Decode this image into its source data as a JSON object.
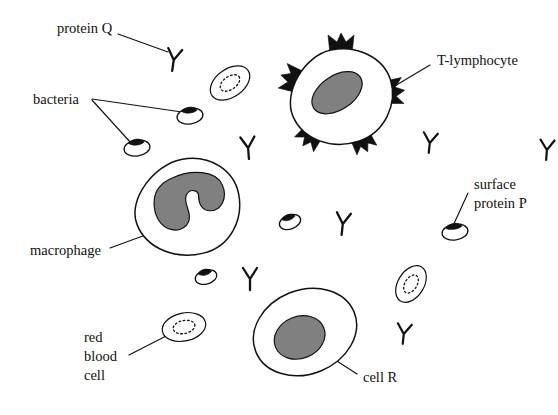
{
  "diagram": {
    "canvas": {
      "width": 558,
      "height": 415
    },
    "background_color": "#ffffff",
    "ink_color": "#111111",
    "nucleus_color": "#808080",
    "labels": [
      {
        "id": "protein-q",
        "text": "protein Q",
        "x": 57,
        "y": 30
      },
      {
        "id": "bacteria",
        "text": "bacteria",
        "x": 33,
        "y": 101
      },
      {
        "id": "t-lymphocyte",
        "text": "T-lymphocyte",
        "x": 437,
        "y": 62
      },
      {
        "id": "macrophage",
        "text": "macrophage",
        "x": 30,
        "y": 252
      },
      {
        "id": "cell-r",
        "text": "cell R",
        "x": 363,
        "y": 379
      },
      {
        "id": "surface-protein-p-line1",
        "text": "surface",
        "x": 474,
        "y": 186
      },
      {
        "id": "surface-protein-p-line2",
        "text": "protein P",
        "x": 474,
        "y": 205
      },
      {
        "id": "red-blood-cell-line1",
        "text": "red",
        "x": 84,
        "y": 339
      },
      {
        "id": "red-blood-cell-line2",
        "text": "blood",
        "x": 84,
        "y": 358
      },
      {
        "id": "red-blood-cell-line3",
        "text": "cell",
        "x": 84,
        "y": 377
      }
    ],
    "cells": [
      {
        "id": "t-lymphocyte",
        "name": "T-lymphocyte",
        "type": "lymphocyte",
        "center_x": 341,
        "center_y": 97,
        "radius_x": 52,
        "radius_y": 48,
        "rotation": -12,
        "nucleus_rx": 28,
        "nucleus_ry": 17,
        "nucleus_rotation": -22,
        "receptor_count": 5,
        "receptor_label": "surface receptor spikes"
      },
      {
        "id": "macrophage",
        "name": "macrophage",
        "type": "macrophage",
        "center_x": 187,
        "center_y": 207,
        "radius_x": 53,
        "radius_y": 48,
        "rotation": -8,
        "nucleus_shape": "multi-lobed"
      },
      {
        "id": "cell-r",
        "name": "cell R",
        "type": "generic-cell",
        "center_x": 305,
        "center_y": 332,
        "radius_x": 53,
        "radius_y": 42,
        "rotation": -22,
        "nucleus_rx": 26,
        "nucleus_ry": 21,
        "nucleus_rotation": -22
      }
    ],
    "red_blood_cells": [
      {
        "id": "rbc-top",
        "center_x": 230,
        "center_y": 83,
        "rx": 22,
        "ry": 14,
        "rotation": -35
      },
      {
        "id": "rbc-bottom-left",
        "center_x": 184,
        "center_y": 327,
        "rx": 22,
        "ry": 14,
        "rotation": -12
      },
      {
        "id": "rbc-right",
        "center_x": 411,
        "center_y": 284,
        "rx": 20,
        "ry": 13,
        "rotation": -58
      }
    ],
    "bacteria": [
      {
        "id": "bacterium-labeled-upper",
        "center_x": 190,
        "center_y": 116,
        "rx": 13,
        "ry": 8,
        "rotation": -8,
        "has_surface_protein": true
      },
      {
        "id": "bacterium-labeled-lower",
        "center_x": 137,
        "center_y": 148,
        "rx": 13,
        "ry": 8,
        "rotation": -8,
        "has_surface_protein": true
      },
      {
        "id": "bacterium-mid",
        "center_x": 290,
        "center_y": 222,
        "rx": 11,
        "ry": 7,
        "rotation": -20,
        "has_surface_protein": true
      },
      {
        "id": "bacterium-lower-left",
        "center_x": 206,
        "center_y": 277,
        "rx": 11,
        "ry": 7,
        "rotation": -15,
        "has_surface_protein": true
      },
      {
        "id": "bacterium-protein-p",
        "center_x": 455,
        "center_y": 232,
        "rx": 13,
        "ry": 8,
        "rotation": -8,
        "has_surface_protein": true
      }
    ],
    "antibodies": [
      {
        "id": "antibody-protein-q",
        "x": 174,
        "y": 58,
        "size": 13,
        "rotation": 8
      },
      {
        "id": "antibody-right-upper",
        "x": 547,
        "y": 148,
        "size": 12,
        "rotation": 4
      },
      {
        "id": "antibody-mid-left",
        "x": 248,
        "y": 146,
        "size": 13,
        "rotation": -4
      },
      {
        "id": "antibody-t-cell-right",
        "x": 430,
        "y": 141,
        "size": 12,
        "rotation": 6
      },
      {
        "id": "antibody-center",
        "x": 343,
        "y": 222,
        "size": 13,
        "rotation": 6
      },
      {
        "id": "antibody-lower-left",
        "x": 250,
        "y": 277,
        "size": 13,
        "rotation": 0
      },
      {
        "id": "antibody-lower-right",
        "x": 404,
        "y": 332,
        "size": 12,
        "rotation": 6
      }
    ],
    "leader_lines": [
      {
        "id": "leader-protein-q",
        "from_label": "protein Q",
        "to_target": "antibody-protein-q",
        "x1": 118,
        "y1": 34,
        "x2": 168,
        "y2": 52
      },
      {
        "id": "leader-bacteria-upper",
        "from_label": "bacteria",
        "to_target": "bacterium-labeled-upper",
        "x1": 92,
        "y1": 99,
        "x2": 182,
        "y2": 112
      },
      {
        "id": "leader-bacteria-lower",
        "from_label": "bacteria",
        "to_target": "bacterium-labeled-lower",
        "x1": 92,
        "y1": 100,
        "x2": 131,
        "y2": 143
      },
      {
        "id": "leader-t-lymphocyte",
        "from_label": "T-lymphocyte",
        "to_target": "t-lymphocyte",
        "x1": 430,
        "y1": 65,
        "x2": 383,
        "y2": 93
      },
      {
        "id": "leader-macrophage",
        "from_label": "macrophage",
        "to_target": "macrophage",
        "x1": 110,
        "y1": 248,
        "x2": 151,
        "y2": 233
      },
      {
        "id": "leader-surface-protein-p",
        "from_label": "surface protein P",
        "to_target": "bacterium-protein-p",
        "x1": 468,
        "y1": 193,
        "x2": 452,
        "y2": 228
      },
      {
        "id": "leader-red-blood-cell",
        "from_label": "red blood cell",
        "to_target": "rbc-bottom-left",
        "x1": 129,
        "y1": 355,
        "x2": 172,
        "y2": 333
      },
      {
        "id": "leader-cell-r",
        "from_label": "cell R",
        "to_target": "cell-r",
        "x1": 357,
        "y1": 374,
        "x2": 326,
        "y2": 354
      }
    ]
  }
}
